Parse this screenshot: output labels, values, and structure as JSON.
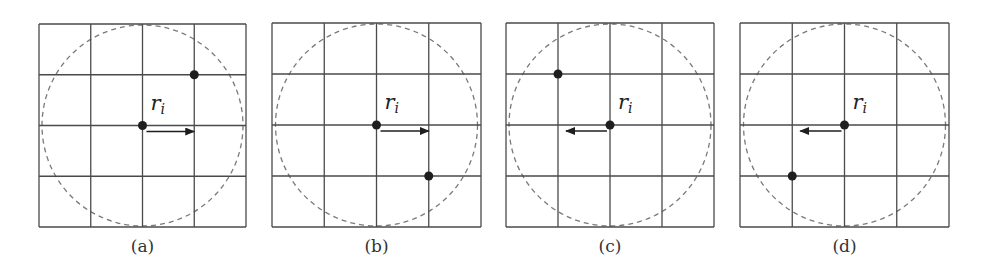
{
  "figure": {
    "colors": {
      "grid": "#4a4a4a",
      "circle": "#7a7a7a",
      "node": "#1e1e1e",
      "arrow": "#1e1e1e"
    },
    "grid_size": 4,
    "panels": [
      {
        "id": "a",
        "caption": "(a)",
        "x": 39,
        "y": 24,
        "w": 207,
        "h": 203,
        "center_label": "r",
        "center_label_sub": "i",
        "arrow_direction": "right",
        "neighbor": {
          "col": 3,
          "row": 1
        }
      },
      {
        "id": "b",
        "caption": "(b)",
        "x": 272,
        "y": 23,
        "w": 209,
        "h": 204,
        "center_label": "r",
        "center_label_sub": "i",
        "arrow_direction": "right",
        "neighbor": {
          "col": 3,
          "row": 3
        }
      },
      {
        "id": "c",
        "caption": "(c)",
        "x": 506,
        "y": 23,
        "w": 208,
        "h": 204,
        "center_label": "r",
        "center_label_sub": "i",
        "arrow_direction": "left",
        "neighbor": {
          "col": 1,
          "row": 1
        }
      },
      {
        "id": "d",
        "caption": "(d)",
        "x": 740,
        "y": 23,
        "w": 209,
        "h": 204,
        "center_label": "r",
        "center_label_sub": "i",
        "arrow_direction": "left",
        "neighbor": {
          "col": 1,
          "row": 3
        }
      }
    ]
  }
}
